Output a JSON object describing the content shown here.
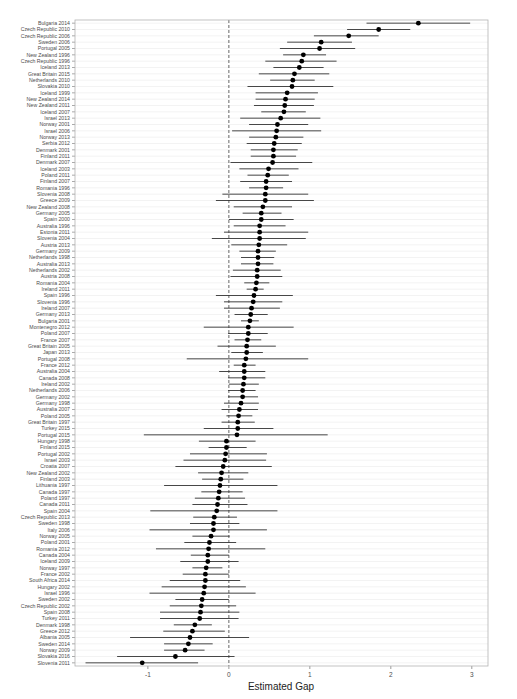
{
  "chart_data": {
    "type": "forest",
    "title": "",
    "xlabel": "Estimated Gap",
    "ylabel": "",
    "xlim": [
      -1.9,
      3.2
    ],
    "xticks": [
      -1,
      0,
      1,
      2,
      3
    ],
    "xtick_labels": [
      "-1",
      "0",
      "1",
      "2",
      "3"
    ],
    "reference_line": 0,
    "grid": true,
    "legend": "none",
    "rows": [
      {
        "label": "Bulgaria 2014",
        "est": 2.34,
        "lo": 1.7,
        "hi": 2.98
      },
      {
        "label": "Czech Republic 2010",
        "est": 1.85,
        "lo": 1.46,
        "hi": 2.24
      },
      {
        "label": "Czech Republic 2006",
        "est": 1.48,
        "lo": 1.05,
        "hi": 1.85
      },
      {
        "label": "Sweden 2006",
        "est": 1.14,
        "lo": 0.72,
        "hi": 1.52
      },
      {
        "label": "Portugal 2005",
        "est": 1.12,
        "lo": 0.63,
        "hi": 1.56
      },
      {
        "label": "New Zealand 1996",
        "est": 0.92,
        "lo": 0.67,
        "hi": 1.2
      },
      {
        "label": "Czech Republic 1996",
        "est": 0.9,
        "lo": 0.45,
        "hi": 1.33
      },
      {
        "label": "Iceland 2013",
        "est": 0.87,
        "lo": 0.55,
        "hi": 1.17
      },
      {
        "label": "Great Britain 2015",
        "est": 0.81,
        "lo": 0.37,
        "hi": 1.24
      },
      {
        "label": "Netherlands 2010",
        "est": 0.79,
        "lo": 0.51,
        "hi": 1.06
      },
      {
        "label": "Slovakia 2010",
        "est": 0.78,
        "lo": 0.23,
        "hi": 1.29
      },
      {
        "label": "Iceland 1999",
        "est": 0.72,
        "lo": 0.33,
        "hi": 1.1
      },
      {
        "label": "New Zealand 2014",
        "est": 0.7,
        "lo": 0.33,
        "hi": 1.06
      },
      {
        "label": "New Zealand 2011",
        "est": 0.69,
        "lo": 0.31,
        "hi": 1.05
      },
      {
        "label": "Iceland 2007",
        "est": 0.68,
        "lo": 0.4,
        "hi": 0.95
      },
      {
        "label": "Israel 2013",
        "est": 0.64,
        "lo": 0.14,
        "hi": 1.13
      },
      {
        "label": "Norway 2001",
        "est": 0.6,
        "lo": 0.25,
        "hi": 0.98
      },
      {
        "label": "Israel 2006",
        "est": 0.59,
        "lo": 0.04,
        "hi": 1.14
      },
      {
        "label": "Norway 2013",
        "est": 0.58,
        "lo": 0.25,
        "hi": 0.92
      },
      {
        "label": "Serbia 2012",
        "est": 0.56,
        "lo": 0.22,
        "hi": 0.9
      },
      {
        "label": "Denmark 2001",
        "est": 0.55,
        "lo": 0.27,
        "hi": 0.85
      },
      {
        "label": "Finland 2011",
        "est": 0.55,
        "lo": 0.27,
        "hi": 0.83
      },
      {
        "label": "Denmark 2007",
        "est": 0.54,
        "lo": 0.02,
        "hi": 1.03
      },
      {
        "label": "Iceland 2003",
        "est": 0.49,
        "lo": 0.13,
        "hi": 0.86
      },
      {
        "label": "Poland 2011",
        "est": 0.48,
        "lo": 0.23,
        "hi": 0.74
      },
      {
        "label": "Finland 2007",
        "est": 0.46,
        "lo": 0.14,
        "hi": 0.78
      },
      {
        "label": "Romania 1996",
        "est": 0.46,
        "lo": 0.25,
        "hi": 0.67
      },
      {
        "label": "Slovenia 2008",
        "est": 0.45,
        "lo": -0.08,
        "hi": 0.98
      },
      {
        "label": "Greece 2009",
        "est": 0.45,
        "lo": -0.16,
        "hi": 1.05
      },
      {
        "label": "New Zealand 2008",
        "est": 0.42,
        "lo": 0.06,
        "hi": 0.78
      },
      {
        "label": "Germany 2005",
        "est": 0.4,
        "lo": 0.17,
        "hi": 0.65
      },
      {
        "label": "Spain 2000",
        "est": 0.4,
        "lo": 0.0,
        "hi": 0.8
      },
      {
        "label": "Australia 1996",
        "est": 0.38,
        "lo": 0.06,
        "hi": 0.7
      },
      {
        "label": "Estonia 2011",
        "est": 0.38,
        "lo": -0.06,
        "hi": 0.98
      },
      {
        "label": "Slovenia 2004",
        "est": 0.38,
        "lo": -0.21,
        "hi": 0.95
      },
      {
        "label": "Austria 2013",
        "est": 0.37,
        "lo": 0.03,
        "hi": 0.72
      },
      {
        "label": "Germany 2009",
        "est": 0.36,
        "lo": 0.13,
        "hi": 0.58
      },
      {
        "label": "Netherlands 1998",
        "est": 0.36,
        "lo": 0.15,
        "hi": 0.56
      },
      {
        "label": "Australia 2013",
        "est": 0.36,
        "lo": 0.15,
        "hi": 0.55
      },
      {
        "label": "Netherlands 2002",
        "est": 0.35,
        "lo": 0.05,
        "hi": 0.64
      },
      {
        "label": "Austria 2008",
        "est": 0.35,
        "lo": 0.02,
        "hi": 0.66
      },
      {
        "label": "Romania 2004",
        "est": 0.34,
        "lo": 0.19,
        "hi": 0.5
      },
      {
        "label": "Ireland 2011",
        "est": 0.33,
        "lo": 0.22,
        "hi": 0.43
      },
      {
        "label": "Spain 1996",
        "est": 0.31,
        "lo": -0.16,
        "hi": 0.79
      },
      {
        "label": "Slovenia 1996",
        "est": 0.3,
        "lo": -0.06,
        "hi": 0.66
      },
      {
        "label": "Ireland 2007",
        "est": 0.28,
        "lo": -0.06,
        "hi": 0.63
      },
      {
        "label": "Germany 2013",
        "est": 0.27,
        "lo": 0.07,
        "hi": 0.48
      },
      {
        "label": "Bulgaria 2001",
        "est": 0.26,
        "lo": 0.15,
        "hi": 0.37
      },
      {
        "label": "Montenegro 2012",
        "est": 0.24,
        "lo": -0.31,
        "hi": 0.8
      },
      {
        "label": "Poland 2007",
        "est": 0.24,
        "lo": -0.01,
        "hi": 0.48
      },
      {
        "label": "France 2007",
        "est": 0.23,
        "lo": 0.07,
        "hi": 0.4
      },
      {
        "label": "Great Britain 2005",
        "est": 0.22,
        "lo": -0.14,
        "hi": 0.58
      },
      {
        "label": "Japan 2013",
        "est": 0.22,
        "lo": 0.03,
        "hi": 0.42
      },
      {
        "label": "Portugal 2008",
        "est": 0.21,
        "lo": -0.52,
        "hi": 0.98
      },
      {
        "label": "France 2012",
        "est": 0.19,
        "lo": 0.06,
        "hi": 0.33
      },
      {
        "label": "Australia 2004",
        "est": 0.19,
        "lo": -0.12,
        "hi": 0.45
      },
      {
        "label": "Canada 2008",
        "est": 0.19,
        "lo": -0.01,
        "hi": 0.45
      },
      {
        "label": "Ireland 2002",
        "est": 0.18,
        "lo": 0.0,
        "hi": 0.37
      },
      {
        "label": "Netherlands 2006",
        "est": 0.17,
        "lo": -0.01,
        "hi": 0.33
      },
      {
        "label": "Germany 2002",
        "est": 0.17,
        "lo": -0.01,
        "hi": 0.36
      },
      {
        "label": "Germany 1998",
        "est": 0.15,
        "lo": -0.06,
        "hi": 0.37
      },
      {
        "label": "Australia 2007",
        "est": 0.13,
        "lo": -0.09,
        "hi": 0.36
      },
      {
        "label": "Poland 2005",
        "est": 0.12,
        "lo": -0.03,
        "hi": 0.29
      },
      {
        "label": "Great Britain 1997",
        "est": 0.11,
        "lo": -0.09,
        "hi": 0.32
      },
      {
        "label": "Turkey 2015",
        "est": 0.11,
        "lo": -0.31,
        "hi": 0.55
      },
      {
        "label": "Portugal 2015",
        "est": 0.1,
        "lo": -1.05,
        "hi": 1.22
      },
      {
        "label": "Hungary 1998",
        "est": -0.03,
        "lo": -0.37,
        "hi": 0.33
      },
      {
        "label": "Finland 2015",
        "est": -0.03,
        "lo": -0.25,
        "hi": 0.22
      },
      {
        "label": "Portugal 2002",
        "est": -0.04,
        "lo": -0.48,
        "hi": 0.47
      },
      {
        "label": "Israel 2003",
        "est": -0.05,
        "lo": -0.56,
        "hi": 0.46
      },
      {
        "label": "Croatia 2007",
        "est": -0.07,
        "lo": -0.66,
        "hi": 0.53
      },
      {
        "label": "New Zealand 2002",
        "est": -0.09,
        "lo": -0.38,
        "hi": 0.24
      },
      {
        "label": "Finland 2003",
        "est": -0.1,
        "lo": -0.33,
        "hi": 0.18
      },
      {
        "label": "Lithuania 1997",
        "est": -0.11,
        "lo": -0.8,
        "hi": 0.6
      },
      {
        "label": "Canada 1997",
        "est": -0.12,
        "lo": -0.34,
        "hi": 0.17
      },
      {
        "label": "Poland 1997",
        "est": -0.13,
        "lo": -0.42,
        "hi": 0.2
      },
      {
        "label": "Canada 2011",
        "est": -0.14,
        "lo": -0.45,
        "hi": 0.23
      },
      {
        "label": "Spain 2004",
        "est": -0.15,
        "lo": -0.97,
        "hi": 0.6
      },
      {
        "label": "Czech Republic 2013",
        "est": -0.18,
        "lo": -0.44,
        "hi": 0.1
      },
      {
        "label": "Sweden 1998",
        "est": -0.19,
        "lo": -0.48,
        "hi": 0.13
      },
      {
        "label": "Italy 2006",
        "est": -0.19,
        "lo": -0.98,
        "hi": 0.47
      },
      {
        "label": "Norway 2005",
        "est": -0.22,
        "lo": -0.45,
        "hi": 0.01
      },
      {
        "label": "Poland 2001",
        "est": -0.24,
        "lo": -0.55,
        "hi": 0.09
      },
      {
        "label": "Romania 2012",
        "est": -0.25,
        "lo": -0.9,
        "hi": 0.45
      },
      {
        "label": "Canada 2004",
        "est": -0.26,
        "lo": -0.47,
        "hi": 0.0
      },
      {
        "label": "Iceland 2009",
        "est": -0.26,
        "lo": -0.6,
        "hi": 0.12
      },
      {
        "label": "Norway 1997",
        "est": -0.28,
        "lo": -0.45,
        "hi": -0.08
      },
      {
        "label": "France 2002",
        "est": -0.29,
        "lo": -0.57,
        "hi": 0.0
      },
      {
        "label": "South Africa 2014",
        "est": -0.29,
        "lo": -0.73,
        "hi": 0.14
      },
      {
        "label": "Hungary 2002",
        "est": -0.3,
        "lo": -0.83,
        "hi": 0.21
      },
      {
        "label": "Israel 1996",
        "est": -0.31,
        "lo": -0.98,
        "hi": 0.33
      },
      {
        "label": "Sweden 2002",
        "est": -0.33,
        "lo": -0.66,
        "hi": 0.0
      },
      {
        "label": "Czech Republic 2002",
        "est": -0.34,
        "lo": -0.73,
        "hi": 0.09
      },
      {
        "label": "Spain 2008",
        "est": -0.35,
        "lo": -0.85,
        "hi": 0.13
      },
      {
        "label": "Turkey 2011",
        "est": -0.36,
        "lo": -0.85,
        "hi": 0.12
      },
      {
        "label": "Denmark 1998",
        "est": -0.42,
        "lo": -0.68,
        "hi": -0.21
      },
      {
        "label": "Greece 2012",
        "est": -0.45,
        "lo": -0.81,
        "hi": -0.05
      },
      {
        "label": "Albania 2005",
        "est": -0.48,
        "lo": -1.22,
        "hi": 0.25
      },
      {
        "label": "Sweden 2014",
        "est": -0.5,
        "lo": -0.8,
        "hi": -0.2
      },
      {
        "label": "Norway 2009",
        "est": -0.54,
        "lo": -0.8,
        "hi": -0.3
      },
      {
        "label": "Slovakia 2016",
        "est": -0.66,
        "lo": -1.38,
        "hi": 0.07
      },
      {
        "label": "Slovenia 2011",
        "est": -1.07,
        "lo": -1.77,
        "hi": -0.38
      }
    ]
  },
  "style": {
    "point_color": "#000000",
    "ci_color": "#333333",
    "grid_color": "#ebebeb",
    "panel_border": "#b3b3b3",
    "refline_color": "#555555",
    "label_color": "#4d4d4d"
  }
}
